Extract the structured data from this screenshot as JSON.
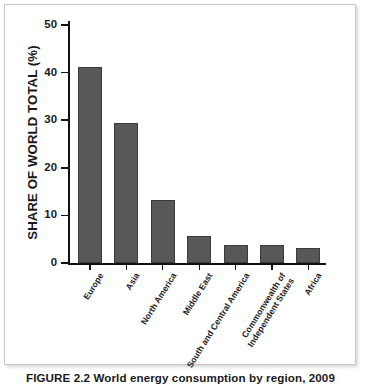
{
  "figure": {
    "caption": "FIGURE 2.2  World energy consumption by region, 2009"
  },
  "chart_data": {
    "type": "bar",
    "title": "",
    "xlabel": "",
    "ylabel": "SHARE OF WORLD TOTAL (%)",
    "ylim": [
      0,
      50
    ],
    "yticks": [
      0,
      10,
      20,
      30,
      40,
      50
    ],
    "ytick_labels": [
      "0",
      "10",
      "20",
      "30",
      "40",
      "50"
    ],
    "grid": false,
    "legend": null,
    "categories": [
      "Europe",
      "Asia",
      "North America",
      "Middle East",
      "South and Central America",
      "Commonwealth of\nIndependent States",
      "Africa"
    ],
    "values": [
      41.2,
      29.4,
      13.2,
      5.7,
      3.8,
      3.7,
      3.2
    ],
    "bar_color": "#585858",
    "bar_edge_color": "#3a3a3a",
    "axis_color": "#111111"
  }
}
